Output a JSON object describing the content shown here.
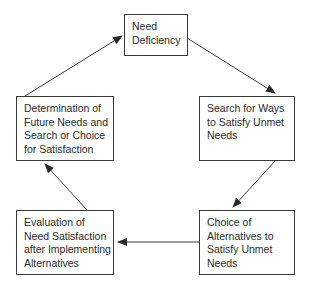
{
  "diagram": {
    "type": "cycle",
    "nodes": [
      {
        "id": "need_deficiency",
        "lines": [
          "Need",
          "Deficiency"
        ]
      },
      {
        "id": "search_ways",
        "lines": [
          "Search for Ways",
          "to Satisfy Unmet",
          "Needs"
        ]
      },
      {
        "id": "choice_alternatives",
        "lines": [
          "Choice of",
          "Alternatives to",
          "Satisfy Unmet",
          "Needs"
        ]
      },
      {
        "id": "evaluation",
        "lines": [
          "Evaluation of",
          "Need Satisfaction",
          "after Implementing",
          "Alternatives"
        ]
      },
      {
        "id": "determination",
        "lines": [
          "Determination of",
          "Future Needs and",
          "Search or Choice",
          "for Satisfaction"
        ]
      }
    ],
    "edges": [
      {
        "from": "need_deficiency",
        "to": "search_ways"
      },
      {
        "from": "search_ways",
        "to": "choice_alternatives"
      },
      {
        "from": "choice_alternatives",
        "to": "evaluation"
      },
      {
        "from": "evaluation",
        "to": "determination"
      },
      {
        "from": "determination",
        "to": "need_deficiency"
      }
    ],
    "colors": {
      "stroke": "#3a3a3a",
      "text": "#2a2a2a",
      "background": "#ffffff"
    }
  }
}
